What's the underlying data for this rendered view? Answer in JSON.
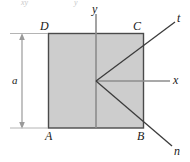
{
  "figure": {
    "name": "square-element-rotated-axes-diagram",
    "shape": {
      "name": "square-plate",
      "fill_color": "#cdcdcd",
      "stroke_color": "#4a4a4a"
    },
    "corner_labels": {
      "top_left": "D",
      "top_right": "C",
      "bottom_left": "A",
      "bottom_right": "B"
    },
    "axis_labels": {
      "y": "y",
      "x": "x",
      "t": "t",
      "n": "n"
    },
    "dimension": {
      "label": "a",
      "orientation": "vertical-left"
    },
    "cropped_top_text": {
      "left": "xy",
      "right": "y"
    },
    "colors": {
      "axis_line": "#8c8c8c",
      "diagonal_line": "#3c3c3c",
      "dimension_line": "#9a9a9a",
      "label_text": "#1a1a1a"
    }
  }
}
